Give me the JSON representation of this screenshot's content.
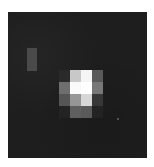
{
  "image": {
    "description": "Grayscale pixelated image of a bright point source on a dark noisy background",
    "background_color": "#1e1e1e",
    "frame": {
      "left": 8,
      "top": 12,
      "width": 139,
      "height": 146
    },
    "faint_feature": {
      "left": 19,
      "top": 36,
      "width": 10,
      "height": 23,
      "color": "#4a4a4a"
    },
    "bright_source": {
      "origin_left": 51,
      "origin_top": 58,
      "cell_width": 11,
      "cell_height": 12,
      "grid": [
        [
          "#2a2a2a",
          "#c8c8c8",
          "#f5f5f5",
          "#5a5a5a"
        ],
        [
          "#6e6e6e",
          "#fafafa",
          "#ffffff",
          "#787878"
        ],
        [
          "#555555",
          "#969696",
          "#d7d7d7",
          "#373737"
        ],
        [
          "#232323",
          "#5f5f5f",
          "#5a5a5a",
          "#232323"
        ]
      ]
    },
    "specks": [
      {
        "left": 117,
        "top": 118
      }
    ]
  }
}
